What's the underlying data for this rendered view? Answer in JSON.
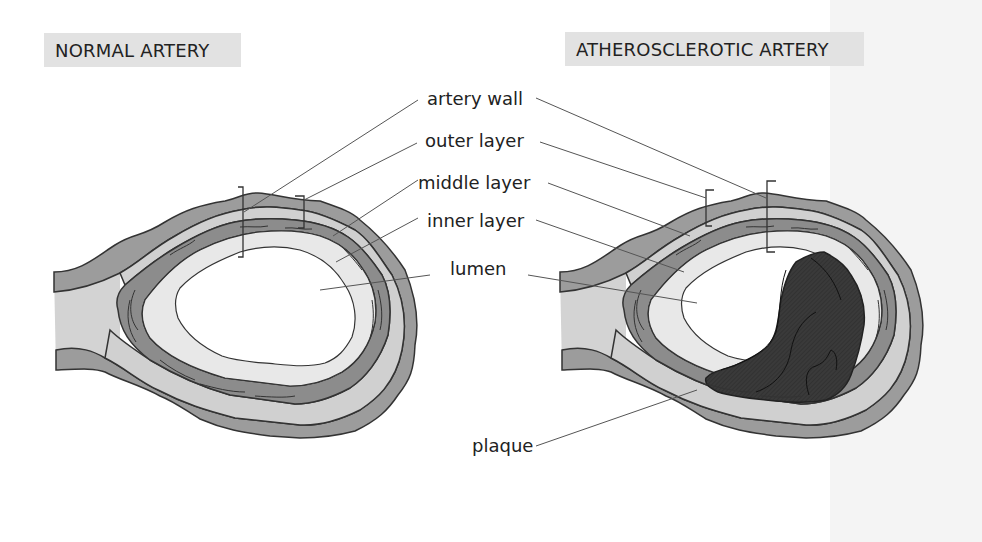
{
  "titles": {
    "normal": "NORMAL ARTERY",
    "atherosclerotic": "ATHEROSCLEROTIC ARTERY"
  },
  "labels": {
    "artery_wall": "artery wall",
    "outer_layer": "outer layer",
    "middle_layer": "middle layer",
    "inner_layer": "inner layer",
    "lumen": "lumen",
    "plaque": "plaque"
  },
  "colors": {
    "outer_layer": "#9a9a9a",
    "middle_layer_band": "#cfcfcf",
    "muscle_layer": "#8a8a8a",
    "inner_layer": "#e6e6e6",
    "lumen": "#ffffff",
    "plaque": "#3a3a3a",
    "title_bg": "#e2e2e2",
    "outline": "#333333"
  }
}
